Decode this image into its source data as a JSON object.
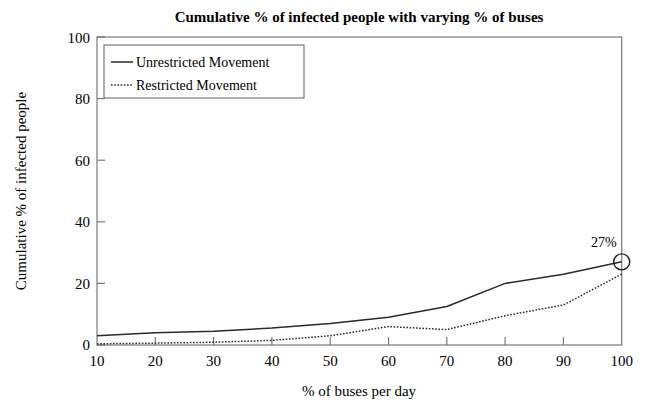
{
  "chart_data": {
    "type": "line",
    "title": "Cumulative % of infected people with varying % of buses",
    "xlabel": "% of buses per day",
    "ylabel": "Cumulative % of infected people",
    "x": [
      10,
      20,
      30,
      40,
      50,
      60,
      70,
      80,
      90,
      100
    ],
    "xlim": [
      10,
      100
    ],
    "ylim": [
      0,
      100
    ],
    "xticks": [
      "10",
      "20",
      "30",
      "40",
      "50",
      "60",
      "70",
      "80",
      "90",
      "100"
    ],
    "yticks": [
      "0",
      "20",
      "40",
      "60",
      "80",
      "100"
    ],
    "grid": false,
    "legend_position": "upper-left",
    "series": [
      {
        "name": "Unrestricted Movement",
        "style": "solid",
        "values": [
          3,
          4,
          4.5,
          5.5,
          7,
          9,
          12.5,
          20,
          23,
          27
        ]
      },
      {
        "name": "Restricted Movement",
        "style": "dotted",
        "values": [
          0.4,
          0.6,
          0.9,
          1.5,
          3,
          6,
          5,
          9.5,
          13,
          23
        ]
      }
    ],
    "annotations": [
      {
        "label": "27%",
        "x": 100,
        "y": 27,
        "series": "Unrestricted Movement",
        "marker": "circle"
      }
    ]
  }
}
